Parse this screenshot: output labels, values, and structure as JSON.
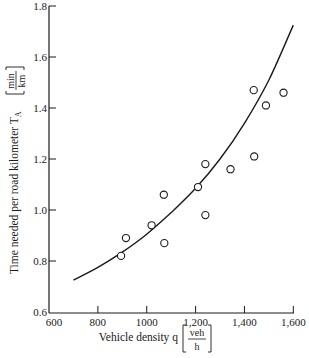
{
  "chart_data": {
    "type": "scatter",
    "title": "",
    "xlabel": "Vehicle density q",
    "xlabel_unit_num": "veh",
    "xlabel_unit_den": "h",
    "ylabel": "Time needed per road kilometer T",
    "ylabel_subscript": "A",
    "ylabel_unit_num": "min",
    "ylabel_unit_den": "km",
    "xlim": [
      600,
      1600
    ],
    "ylim": [
      0.6,
      1.8
    ],
    "x_ticks": [
      600,
      800,
      1000,
      1200,
      1400,
      1600
    ],
    "x_tick_labels": [
      "600",
      "800",
      "1000",
      "1,200",
      "1,400",
      "1,600"
    ],
    "y_ticks": [
      0.6,
      0.8,
      1.0,
      1.2,
      1.4,
      1.6,
      1.8
    ],
    "y_tick_labels": [
      "0.6",
      "0.8",
      "1.0",
      "1.2",
      "1.4",
      "1.6",
      "1.8"
    ],
    "grid": false,
    "legend": null,
    "series": [
      {
        "name": "observations",
        "type": "scatter",
        "marker": "open-circle",
        "points": [
          {
            "x": 895,
            "y": 0.82
          },
          {
            "x": 915,
            "y": 0.89
          },
          {
            "x": 1020,
            "y": 0.94
          },
          {
            "x": 1070,
            "y": 1.06
          },
          {
            "x": 1072,
            "y": 0.87
          },
          {
            "x": 1210,
            "y": 1.09
          },
          {
            "x": 1240,
            "y": 1.18
          },
          {
            "x": 1240,
            "y": 0.98
          },
          {
            "x": 1343,
            "y": 1.16
          },
          {
            "x": 1440,
            "y": 1.21
          },
          {
            "x": 1438,
            "y": 1.47
          },
          {
            "x": 1488,
            "y": 1.41
          },
          {
            "x": 1560,
            "y": 1.46
          }
        ]
      },
      {
        "name": "fitted curve",
        "type": "line",
        "points": [
          {
            "x": 700,
            "y": 0.725
          },
          {
            "x": 800,
            "y": 0.775
          },
          {
            "x": 900,
            "y": 0.835
          },
          {
            "x": 1000,
            "y": 0.905
          },
          {
            "x": 1100,
            "y": 0.99
          },
          {
            "x": 1200,
            "y": 1.085
          },
          {
            "x": 1300,
            "y": 1.2
          },
          {
            "x": 1400,
            "y": 1.34
          },
          {
            "x": 1500,
            "y": 1.51
          },
          {
            "x": 1600,
            "y": 1.725
          }
        ]
      }
    ]
  },
  "style": {
    "ink": "#1a1a1a",
    "background": "#ffffff"
  }
}
